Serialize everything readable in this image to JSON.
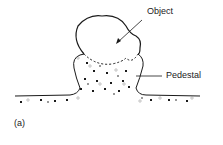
{
  "diagram": {
    "labels": {
      "object": "Object",
      "pedestal": "Pedestal",
      "panel": "(a)"
    },
    "colors": {
      "line": "#1a1a1a",
      "label": "#222222",
      "background": "#ffffff"
    }
  }
}
